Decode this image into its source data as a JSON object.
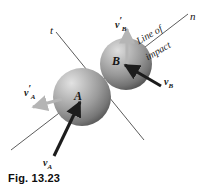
{
  "figure": {
    "caption": "Fig. 13.23",
    "background_color": "#ffffff"
  },
  "axes": [
    {
      "name": "n-axis",
      "label": "n",
      "label_x": 190,
      "label_y": 11
    },
    {
      "name": "t-axis",
      "label": "t",
      "label_x": 50,
      "label_y": 25
    }
  ],
  "annotations": [
    {
      "name": "line-of-impact-line1",
      "text": "Line of",
      "x": 137,
      "y": 36,
      "rotation": -30
    },
    {
      "name": "line-of-impact-line2",
      "text": "impact",
      "x": 146,
      "y": 52,
      "rotation": -30
    }
  ],
  "bodies": [
    {
      "name": "sphere-a",
      "label": "A",
      "cx": 82,
      "cy": 97,
      "r": 29,
      "label_x": 74,
      "label_y": 90
    },
    {
      "name": "sphere-b",
      "label": "B",
      "cx": 126,
      "cy": 64,
      "r": 26,
      "label_x": 112,
      "label_y": 55
    }
  ],
  "vectors": [
    {
      "name": "velocity-a-incoming",
      "label_base": "v",
      "label_prime": "",
      "label_sub": "A",
      "color": "#1c1c1c",
      "label_x": 43,
      "label_y": 158,
      "x1": 54,
      "y1": 156,
      "x2": 80,
      "y2": 101
    },
    {
      "name": "velocity-b-incoming",
      "label_base": "v",
      "label_prime": "",
      "label_sub": "B",
      "color": "#1c1c1c",
      "label_x": 164,
      "label_y": 77,
      "x1": 162,
      "y1": 86,
      "x2": 124,
      "y2": 64
    },
    {
      "name": "velocity-a-outgoing",
      "label_base": "v",
      "label_prime": "′",
      "label_sub": "A",
      "color": "#b5b5b5",
      "label_x": 24,
      "label_y": 84,
      "x1": 62,
      "y1": 99,
      "x2": 31,
      "y2": 108
    },
    {
      "name": "velocity-b-outgoing",
      "label_base": "v",
      "label_prime": "′",
      "label_sub": "B",
      "color": "#b5b5b5",
      "label_x": 115,
      "label_y": 16,
      "x1": 127,
      "y1": 64,
      "x2": 127,
      "y2": 28
    }
  ],
  "colors": {
    "axis_line": "#4a4a4a",
    "sphere_light": "#d8d8d8",
    "sphere_mid": "#9a9a9a",
    "sphere_dark": "#585858",
    "vector_dark": "#1c1c1c",
    "vector_light": "#b5b5b5",
    "text": "#161616"
  }
}
